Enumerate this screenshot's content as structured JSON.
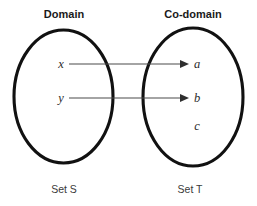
{
  "diagram": {
    "title_domain": "Domain",
    "title_codomain": "Co-domain",
    "set_s_label": "Set S",
    "set_t_label": "Set T",
    "domain_elements": [
      {
        "label": "x",
        "cx": 61,
        "cy": 68
      },
      {
        "label": "y",
        "cx": 61,
        "cy": 102
      }
    ],
    "codomain_elements": [
      {
        "label": "a",
        "cx": 197,
        "cy": 68
      },
      {
        "label": "b",
        "cx": 197,
        "cy": 102
      },
      {
        "label": "c",
        "cx": 197,
        "cy": 130
      }
    ],
    "mappings": [
      {
        "from": "x",
        "to": "a",
        "y": 64,
        "x1": 69,
        "x2": 188
      },
      {
        "from": "y",
        "to": "b",
        "y": 98,
        "x1": 69,
        "x2": 188
      }
    ],
    "sets": {
      "domain": {
        "cx": 63.5,
        "cy": 96.5,
        "rx": 49.5,
        "ry": 66.5
      },
      "codomain": {
        "cx": 193,
        "cy": 97,
        "rx": 50,
        "ry": 69
      }
    },
    "colors": {
      "ellipse_stroke": "#111111",
      "arrow": "#2f2f2f",
      "text": "#1a1a1a",
      "background": "#ffffff"
    }
  }
}
